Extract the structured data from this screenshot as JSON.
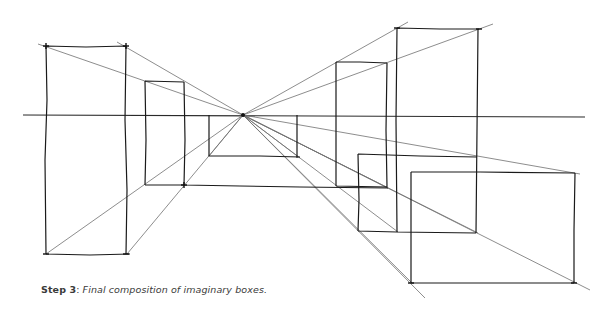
{
  "caption": {
    "step_label": "Step 3",
    "separator": ": ",
    "description": "Final composition of imaginary boxes."
  },
  "colors": {
    "background": "#ffffff",
    "ink": "#1a1a1a",
    "guide": "#6e6e6e",
    "caption_text": "#3a3a3a"
  },
  "diagram": {
    "type": "one-point perspective sketch",
    "horizon_y": 115,
    "vanishing_point": {
      "x": 243,
      "y": 115
    },
    "boxes": [
      {
        "id": "left-tall",
        "x1": 46,
        "y1": 46,
        "x2": 126,
        "y2": 254
      },
      {
        "id": "left-small",
        "x1": 145,
        "y1": 81,
        "x2": 184,
        "y2": 185
      },
      {
        "id": "center-back",
        "x1": 209,
        "y1": 115,
        "x2": 297,
        "y2": 156
      },
      {
        "id": "right-mid",
        "x1": 336,
        "y1": 62,
        "x2": 387,
        "y2": 187
      },
      {
        "id": "right-tall",
        "x1": 397,
        "y1": 28,
        "x2": 478,
        "y2": 232
      },
      {
        "id": "right-low-back",
        "x1": 358,
        "y1": 154,
        "x2": 476,
        "y2": 232
      },
      {
        "id": "right-low-front",
        "x1": 411,
        "y1": 172,
        "x2": 575,
        "y2": 283
      }
    ]
  }
}
